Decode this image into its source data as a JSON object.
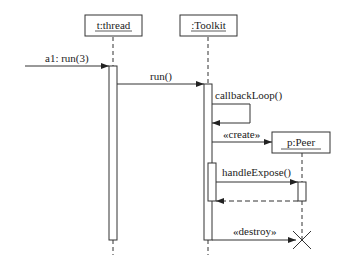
{
  "diagram": {
    "type": "uml-sequence",
    "objects": [
      {
        "id": "thread",
        "name": "t:thread"
      },
      {
        "id": "toolkit",
        "name": ":Toolkit"
      },
      {
        "id": "peer",
        "name": "p:Peer"
      }
    ],
    "messages": [
      {
        "label": "a1: run(3)",
        "from": "external",
        "to": "thread",
        "kind": "sync"
      },
      {
        "label": "run()",
        "from": "thread",
        "to": "toolkit",
        "kind": "sync"
      },
      {
        "label": "callbackLoop()",
        "from": "toolkit",
        "to": "toolkit",
        "kind": "self"
      },
      {
        "label": "«create»",
        "from": "toolkit",
        "to": "peer",
        "kind": "create"
      },
      {
        "label": "handleExpose()",
        "from": "toolkit",
        "to": "peer",
        "kind": "sync"
      },
      {
        "label": "",
        "from": "peer",
        "to": "toolkit",
        "kind": "return"
      },
      {
        "label": "«destroy»",
        "from": "toolkit",
        "to": "peer",
        "kind": "destroy"
      }
    ]
  }
}
